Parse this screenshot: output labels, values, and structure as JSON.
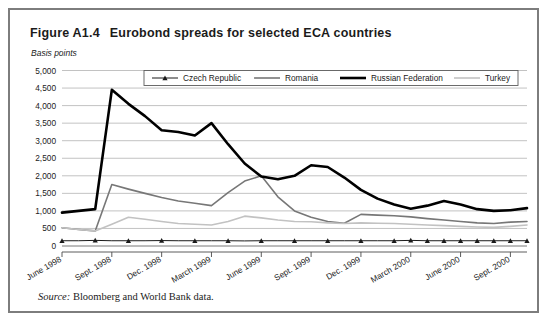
{
  "figure": {
    "number": "Figure A1.4",
    "title": "Eurobond spreads for selected ECA countries",
    "unit_label": "Basis points",
    "source_label": "Source:",
    "source_text": "Bloomberg and World Bank data."
  },
  "chart_data": {
    "type": "line",
    "title": "Eurobond spreads for selected ECA countries",
    "xlabel": "",
    "ylabel": "Basis points",
    "ylim": [
      0,
      5000
    ],
    "ytick_values": [
      0,
      500,
      1000,
      1500,
      2000,
      2500,
      3000,
      3500,
      4000,
      4500,
      5000
    ],
    "ytick_labels": [
      "0",
      "500",
      "1,000",
      "1,500",
      "2,000",
      "2,500",
      "3,000",
      "3,500",
      "4,000",
      "4,500",
      "5,000"
    ],
    "grid": true,
    "legend_position": "top-center",
    "xtick_labels": [
      "June 1998",
      "Sept. 1998",
      "Dec. 1998",
      "March 1999",
      "June 1999",
      "Sept. 1999",
      "Dec. 1999",
      "March 2000",
      "June 2000",
      "Sept. 2000"
    ],
    "xtick_indices": [
      0,
      3,
      6,
      9,
      12,
      15,
      18,
      21,
      24,
      27
    ],
    "x": [
      0,
      1,
      2,
      3,
      4,
      5,
      6,
      7,
      8,
      9,
      10,
      11,
      12,
      13,
      14,
      15,
      16,
      17,
      18,
      19,
      20,
      21,
      22,
      23,
      24,
      25,
      26,
      27,
      28
    ],
    "series": [
      {
        "name": "Czech Republic",
        "color": "#1b1b1b",
        "width": 1.0,
        "marker": "triangle",
        "values": [
          150,
          150,
          160,
          150,
          150,
          150,
          155,
          150,
          150,
          150,
          150,
          145,
          150,
          150,
          150,
          150,
          150,
          150,
          150,
          150,
          150,
          160,
          150,
          150,
          150,
          150,
          150,
          150,
          150
        ]
      },
      {
        "name": "Romania",
        "color": "#777777",
        "width": 1.6,
        "marker": "none",
        "values": [
          520,
          470,
          430,
          1750,
          1620,
          1500,
          1380,
          1280,
          1220,
          1150,
          1520,
          1850,
          2000,
          1400,
          1000,
          820,
          700,
          650,
          900,
          880,
          860,
          830,
          780,
          740,
          700,
          660,
          640,
          680,
          700
        ]
      },
      {
        "name": "Russian Federation",
        "color": "#000000",
        "width": 2.6,
        "marker": "none",
        "values": [
          950,
          1000,
          1050,
          4450,
          4050,
          3700,
          3300,
          3250,
          3150,
          3500,
          2900,
          2350,
          1980,
          1900,
          2000,
          2300,
          2250,
          1950,
          1600,
          1350,
          1180,
          1060,
          1150,
          1280,
          1180,
          1050,
          1000,
          1020,
          1080
        ]
      },
      {
        "name": "Turkey",
        "color": "#c2c2c2",
        "width": 1.6,
        "marker": "none",
        "values": [
          520,
          470,
          430,
          620,
          820,
          760,
          700,
          640,
          620,
          600,
          700,
          850,
          800,
          740,
          700,
          690,
          660,
          640,
          660,
          650,
          640,
          620,
          600,
          580,
          560,
          540,
          530,
          560,
          600
        ]
      }
    ]
  }
}
